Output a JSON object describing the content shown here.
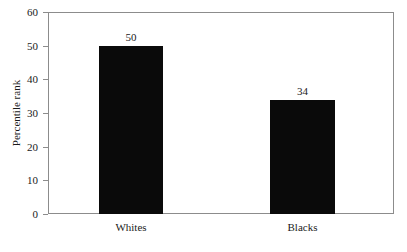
{
  "chart_data": {
    "type": "bar",
    "title": "",
    "subtitle": "",
    "xlabel": "",
    "ylabel": "Percentile rank",
    "categories": [
      "Whites",
      "Blacks"
    ],
    "values": [
      50,
      34
    ],
    "data_labels": [
      "50",
      "34"
    ],
    "ylim": [
      0,
      60
    ],
    "ytick_labels": [
      "0",
      "10",
      "20",
      "30",
      "40",
      "50",
      "60"
    ],
    "ytick_values": [
      0,
      10,
      20,
      30,
      40,
      50,
      60
    ],
    "grid": false,
    "legend": null,
    "bar_color": "#0a0a0a",
    "axis_color": "#8c8c8c",
    "text_color": "#1a1a1a",
    "background_color": "#ffffff"
  }
}
